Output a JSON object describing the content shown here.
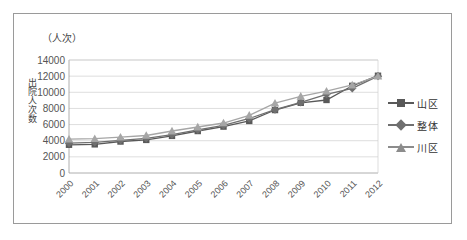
{
  "chart_data": {
    "type": "line",
    "title": "",
    "unit_label": "（人次）",
    "ylabel": "出院人次数",
    "xlabel": "",
    "categories": [
      "2000",
      "2001",
      "2002",
      "2003",
      "2004",
      "2005",
      "2006",
      "2007",
      "2008",
      "2009",
      "2010",
      "2011",
      "2012"
    ],
    "yticks": [
      0,
      2000,
      4000,
      6000,
      8000,
      10000,
      12000,
      14000
    ],
    "ylim": [
      0,
      14000
    ],
    "grid": true,
    "legend_position": "right",
    "series": [
      {
        "name": "山区",
        "marker": "square",
        "color": "#595959",
        "values": [
          3500,
          3550,
          3900,
          4100,
          4600,
          5200,
          5750,
          6450,
          7800,
          8700,
          9050,
          10800,
          12050
        ]
      },
      {
        "name": "整体",
        "marker": "diamond",
        "color": "#6f6f6f",
        "values": [
          3700,
          3800,
          4050,
          4300,
          4750,
          5350,
          5900,
          6750,
          7850,
          8750,
          9750,
          10500,
          12000
        ]
      },
      {
        "name": "川区",
        "marker": "triangle",
        "color": "#a6a6a6",
        "values": [
          4200,
          4250,
          4450,
          4650,
          5200,
          5700,
          6200,
          7150,
          8650,
          9500,
          10150,
          10900,
          12000
        ]
      }
    ]
  },
  "legend": {
    "items": [
      {
        "label": "山区"
      },
      {
        "label": "整体"
      },
      {
        "label": "川区"
      }
    ]
  }
}
